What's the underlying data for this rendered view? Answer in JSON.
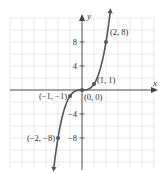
{
  "chart_data": {
    "type": "line",
    "title": "",
    "xlabel": "x",
    "ylabel": "y",
    "function": "y = x^3",
    "xlim": [
      -6,
      6
    ],
    "ylim": [
      -12,
      12
    ],
    "grid": true,
    "y_ticks": [
      8,
      4,
      -4,
      -8
    ],
    "y_tick_labels": [
      "8",
      "4",
      "−4",
      "−8"
    ],
    "points": [
      {
        "x": -2,
        "y": -8,
        "label": "(−2, −8)"
      },
      {
        "x": -1,
        "y": -1,
        "label": "(−1, −1)"
      },
      {
        "x": 0,
        "y": 0,
        "label": "(0, 0)"
      },
      {
        "x": 1,
        "y": 1,
        "label": "(1, 1)"
      },
      {
        "x": 2,
        "y": 8,
        "label": "(2, 8)"
      }
    ],
    "colors": {
      "curve": "#555555",
      "grid": "#dcdcdc",
      "axis": "#444444"
    }
  }
}
